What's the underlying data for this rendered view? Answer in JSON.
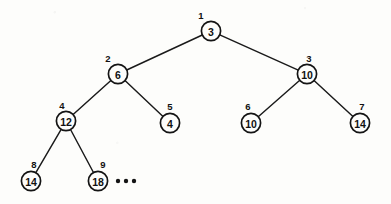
{
  "figure": {
    "type": "binary-heap-tree-diagram",
    "background_color": "#fdfdfb",
    "stroke_color": "#141414",
    "width": 391,
    "height": 204
  },
  "chart_data": {
    "type": "diagram",
    "subtype": "binary-tree",
    "title": "",
    "xlabel": "",
    "ylabel": "",
    "node_count": 9,
    "node_radius": 9.6,
    "nodes": [
      {
        "index": "1",
        "value": "3",
        "cx": 211,
        "cy": 31,
        "index_dx": -10,
        "index_dy": -16
      },
      {
        "index": "2",
        "value": "6",
        "cx": 118,
        "cy": 74,
        "index_dx": -10,
        "index_dy": -16
      },
      {
        "index": "3",
        "value": "10",
        "cx": 307,
        "cy": 74,
        "index_dx": 2,
        "index_dy": -16
      },
      {
        "index": "4",
        "value": "12",
        "cx": 66,
        "cy": 121,
        "index_dx": -4,
        "index_dy": -16
      },
      {
        "index": "5",
        "value": "4",
        "cx": 170,
        "cy": 123,
        "index_dx": 0,
        "index_dy": -17
      },
      {
        "index": "6",
        "value": "10",
        "cx": 251,
        "cy": 123,
        "index_dx": -3,
        "index_dy": -17
      },
      {
        "index": "7",
        "value": "14",
        "cx": 360,
        "cy": 123,
        "index_dx": 2,
        "index_dy": -17
      },
      {
        "index": "8",
        "value": "14",
        "cx": 31,
        "cy": 181,
        "index_dx": 3,
        "index_dy": -17
      },
      {
        "index": "9",
        "value": "18",
        "cx": 98,
        "cy": 181,
        "index_dx": 5,
        "index_dy": -17
      }
    ],
    "edges": [
      {
        "from": "1",
        "to": "2",
        "label": "root-to-left-child"
      },
      {
        "from": "1",
        "to": "3",
        "label": "root-to-right-child"
      },
      {
        "from": "2",
        "to": "4",
        "label": "node2-to-left-child"
      },
      {
        "from": "2",
        "to": "5",
        "label": "node2-to-right-child"
      },
      {
        "from": "3",
        "to": "6",
        "label": "node3-to-left-child"
      },
      {
        "from": "3",
        "to": "7",
        "label": "node3-to-right-child"
      },
      {
        "from": "4",
        "to": "8",
        "label": "node4-to-left-child"
      },
      {
        "from": "4",
        "to": "9",
        "label": "node4-to-right-child"
      }
    ],
    "ellipsis": {
      "present": true,
      "label": "continues",
      "dots": [
        {
          "cx": 118,
          "cy": 181,
          "r": 2.2
        },
        {
          "cx": 126,
          "cy": 181,
          "r": 2.2
        },
        {
          "cx": 134,
          "cy": 181,
          "r": 2.2
        }
      ]
    },
    "values_in_heap_order": [
      "3",
      "6",
      "10",
      "12",
      "4",
      "10",
      "14",
      "14",
      "18"
    ],
    "indices_in_heap_order": [
      "1",
      "2",
      "3",
      "4",
      "5",
      "6",
      "7",
      "8",
      "9"
    ]
  }
}
